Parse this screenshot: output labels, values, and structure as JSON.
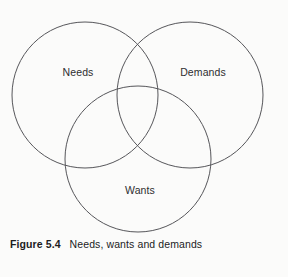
{
  "figure": {
    "caption_number": "Figure 5.4",
    "caption_text": "Needs, wants and demands",
    "stroke_color": "#56565a",
    "background_color": "#fbfbfa",
    "text_color": "#2e2e30"
  },
  "diagram": {
    "type": "venn",
    "circles": [
      {
        "id": "needs",
        "label": "Needs",
        "cx": 85,
        "cy": 95,
        "r": 73
      },
      {
        "id": "demands",
        "label": "Demands",
        "cx": 190,
        "cy": 95,
        "r": 73
      },
      {
        "id": "wants",
        "label": "Wants",
        "cx": 138,
        "cy": 159,
        "r": 73
      }
    ]
  },
  "chart_data": {
    "type": "diagram",
    "subtype": "venn-three-circle",
    "title": "Needs, wants and demands",
    "sets": [
      "Needs",
      "Demands",
      "Wants"
    ],
    "circles": [
      {
        "name": "Needs",
        "cx": 85,
        "cy": 95,
        "r": 73
      },
      {
        "name": "Demands",
        "cx": 190,
        "cy": 95,
        "r": 73
      },
      {
        "name": "Wants",
        "cx": 138,
        "cy": 159,
        "r": 73
      }
    ],
    "overlaps": [
      [
        "Needs",
        "Demands"
      ],
      [
        "Needs",
        "Wants"
      ],
      [
        "Demands",
        "Wants"
      ],
      [
        "Needs",
        "Demands",
        "Wants"
      ]
    ],
    "legend": "none",
    "grid": false
  }
}
